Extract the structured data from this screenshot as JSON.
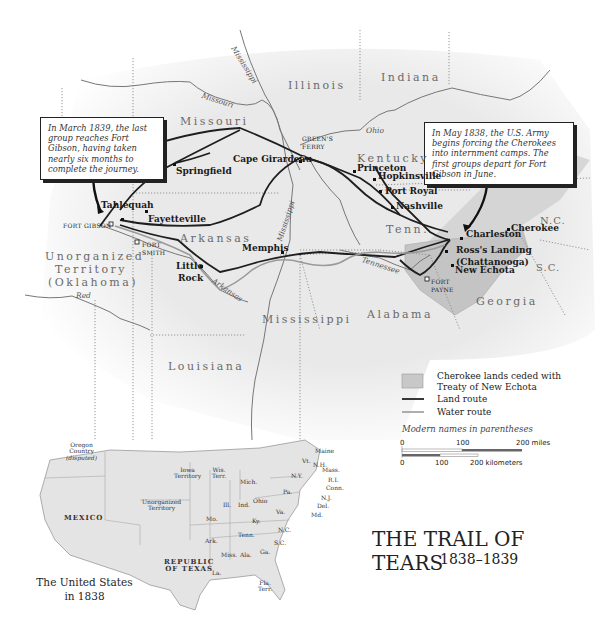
{
  "title": {
    "main": "THE TRAIL OF TEARS",
    "years": "1838–1839"
  },
  "callouts": [
    {
      "id": "west",
      "text": "In March 1839, the last group reaches Fort Gibson, having taken nearly six months to complete the journey."
    },
    {
      "id": "east",
      "text": "In May 1838, the U.S. Army begins forcing the Cherokees into internment camps. The first groups depart for Fort Gibson in June."
    }
  ],
  "states": {
    "illinois": "Illinois",
    "indiana": "Indiana",
    "missouri": "Missouri",
    "kentucky": "Kentucky",
    "tennessee": "Tenn.",
    "arkansas": "Arkansas",
    "mississippi": "Mississippi",
    "alabama": "Alabama",
    "georgia": "Georgia",
    "louisiana": "Louisiana",
    "north_carolina": "N.C.",
    "south_carolina": "S.C.",
    "unorganized_1": "Unorganized",
    "unorganized_2": "Territory",
    "unorganized_3": "(Oklahoma)"
  },
  "cities": {
    "cape_girardeau": "Cape Girardeau",
    "springfield": "Springfield",
    "tahlequah": "Tahlequah",
    "fayetteville": "Fayetteville",
    "memphis": "Memphis",
    "little_rock_1": "Little",
    "little_rock_2": "Rock",
    "princeton": "Princeton",
    "hopkinsville": "Hopkinsville",
    "port_royal": "Port Royal",
    "nashville": "Nashville",
    "charleston": "Charleston",
    "cherokee": "Cherokee",
    "ross_landing_1": "Ross's Landing",
    "ross_landing_2": "(Chattanooga)",
    "new_echota": "New Echota"
  },
  "forts": {
    "fort_gibson": "FORT GIBSON",
    "fort_smith_1": "FORT",
    "fort_smith_2": "SMITH",
    "greens_ferry_1": "GREEN'S",
    "greens_ferry_2": "FERRY",
    "fort_payne_1": "FORT",
    "fort_payne_2": "PAYNE"
  },
  "rivers": {
    "mississippi_north": "Mississippi",
    "mississippi_south": "Mississippi",
    "missouri": "Missouri",
    "ohio": "Ohio",
    "arkansas": "Arkansas",
    "red": "Red",
    "tennessee": "Tennessee"
  },
  "legend": {
    "ceded_1": "Cherokee lands ceded with",
    "ceded_2": "Treaty of New Echota",
    "land_route": "Land route",
    "water_route": "Water route",
    "note": "Modern names in parentheses",
    "colors": {
      "ceded": "#c8c8c8",
      "land_route": "#222222",
      "water_route": "#9a9a9a"
    }
  },
  "scale": {
    "miles_ticks": [
      "0",
      "100",
      "200 miles"
    ],
    "km_ticks": [
      "0",
      "100",
      "200 kilometers"
    ]
  },
  "inset": {
    "caption_1": "The United States",
    "caption_2": "in 1838",
    "labels": {
      "oregon_1": "Oregon",
      "oregon_2": "Country",
      "oregon_3": "(disputed)",
      "mexico": "MEXICO",
      "iowa_1": "Iowa",
      "iowa_2": "Territory",
      "wis_1": "Wis.",
      "wis_2": "Terr.",
      "mich": "Mich.",
      "unorg_1": "Unorganized",
      "unorg_2": "Territory",
      "ill": "Ill.",
      "ind": "Ind.",
      "ohio": "Ohio",
      "pa": "Pa.",
      "ny": "N.Y.",
      "vt": "Vt.",
      "nh": "N.H.",
      "maine": "Maine",
      "mass": "Mass.",
      "ri": "R.I.",
      "conn": "Conn.",
      "nj": "N.J.",
      "del": "Del.",
      "md": "Md.",
      "mo": "Mo.",
      "ky": "Ky.",
      "va": "Va.",
      "tenn": "Tenn.",
      "nc": "N.C.",
      "sc": "S.C.",
      "ark": "Ark.",
      "miss": "Miss.",
      "ala": "Ala.",
      "ga": "Ga.",
      "texas_1": "REPUBLIC",
      "texas_2": "OF TEXAS",
      "la": "La.",
      "fla_1": "Fla.",
      "fla_2": "Terr."
    }
  }
}
